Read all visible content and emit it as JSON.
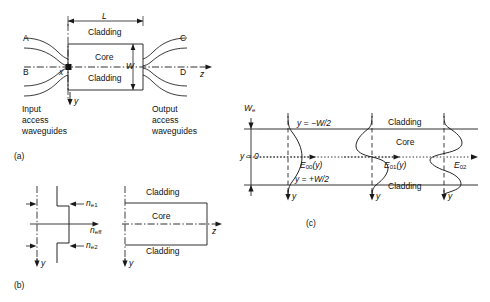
{
  "figure": {
    "panels": [
      {
        "id": "a",
        "caption": "(a)"
      },
      {
        "id": "b",
        "caption": "(b)"
      },
      {
        "id": "c",
        "caption": "(c)"
      }
    ]
  },
  "panel_a": {
    "caption": "(a)",
    "length_label": "L",
    "width_label": "W",
    "cladding_top": "Cladding",
    "cladding_bottom": "Cladding",
    "core": "Core",
    "port_a": "A",
    "port_b": "B",
    "port_c": "C",
    "port_d": "D",
    "axis_x": "x",
    "axis_y": "y",
    "axis_z": "z",
    "input_text": "Input\naccess\nwaveguides",
    "output_text": "Output\naccess\nwaveguides"
  },
  "panel_b": {
    "caption": "(b)",
    "index_upper": "n",
    "index_upper_sub": "e1",
    "index_eff": "n",
    "index_eff_sub": "eff",
    "index_lower": "n",
    "index_lower_sub": "e2",
    "axis_y_left": "y",
    "axis_y_right": "y",
    "axis_z": "z",
    "cladding_top": "Cladding",
    "core": "Core",
    "cladding_bottom": "Cladding"
  },
  "panel_c": {
    "caption": "(c)",
    "we_label": "W",
    "we_sub": "e",
    "y_top": "y = −W/2",
    "y_zero": "y = 0",
    "y_bottom": "y = +W/2",
    "cladding_top": "Cladding",
    "core": "Core",
    "cladding_bottom": "Cladding",
    "mode_0": "E",
    "mode_0_sub": "00",
    "mode_0_arg": "(y)",
    "mode_1": "E",
    "mode_1_sub": "01",
    "mode_1_arg": "(y)",
    "mode_2": "E",
    "mode_2_sub": "02",
    "mode_2_arg": "",
    "axis_y_1": "y",
    "axis_y_2": "y",
    "axis_y_3": "y"
  },
  "colors": {
    "line": "#1a1a1a",
    "text": "#111111",
    "background": "#ffffff"
  }
}
